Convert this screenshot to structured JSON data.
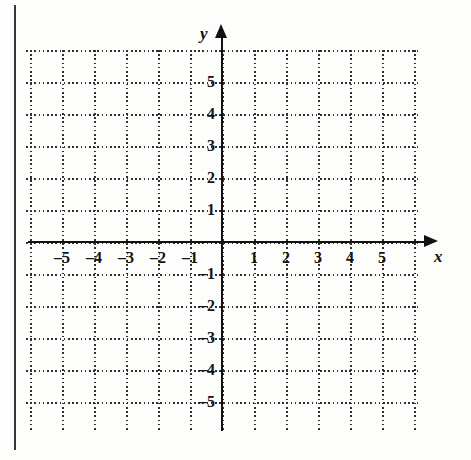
{
  "figure": {
    "kind": "cartesian-coordinate-plane",
    "background_color": "#fdfdfc",
    "ink_color": "#111111",
    "grid_color": "#303030"
  },
  "axes": {
    "x_axis_label": "x",
    "y_axis_label": "y",
    "x_tick_labels": [
      "–5",
      "–4",
      "–3",
      "–2",
      "–1",
      "1",
      "2",
      "3",
      "4",
      "5"
    ],
    "y_tick_labels": [
      "5",
      "4",
      "3",
      "2",
      "1",
      "–1",
      "–2",
      "–3",
      "–4",
      "–5"
    ]
  },
  "chart_data": {
    "type": "scatter",
    "title": "",
    "subtitle": "",
    "xlabel": "x",
    "ylabel": "y",
    "xlim": [
      -6,
      6
    ],
    "ylim": [
      -6,
      6
    ],
    "xticks": [
      -5,
      -4,
      -3,
      -2,
      -1,
      1,
      2,
      3,
      4,
      5
    ],
    "yticks": [
      5,
      4,
      3,
      2,
      1,
      -1,
      -2,
      -3,
      -4,
      -5
    ],
    "xtick_labels": [
      "–5",
      "–4",
      "–3",
      "–2",
      "–1",
      "1",
      "2",
      "3",
      "4",
      "5"
    ],
    "ytick_labels": [
      "5",
      "4",
      "3",
      "2",
      "1",
      "–1",
      "–2",
      "–3",
      "–4",
      "–5"
    ],
    "grid": true,
    "grid_style": "dotted",
    "grid_spacing": 1,
    "legend": null,
    "series": [],
    "annotations": [],
    "note": "Empty blank grid — no data plotted; a worksheet graph for the reader to plot on."
  },
  "geometry": {
    "origin_px": [
      222,
      242
    ],
    "cell_px": 32,
    "grid_left_px": 26,
    "grid_top_px": 50,
    "grid_right_px": 420,
    "grid_bottom_px": 430,
    "x_cells": [
      -6,
      -5,
      -4,
      -3,
      -2,
      -1,
      0,
      1,
      2,
      3,
      4,
      5,
      6
    ],
    "y_cells": [
      6,
      5,
      4,
      3,
      2,
      1,
      0,
      -1,
      -2,
      -3,
      -4,
      -5,
      -6
    ]
  }
}
